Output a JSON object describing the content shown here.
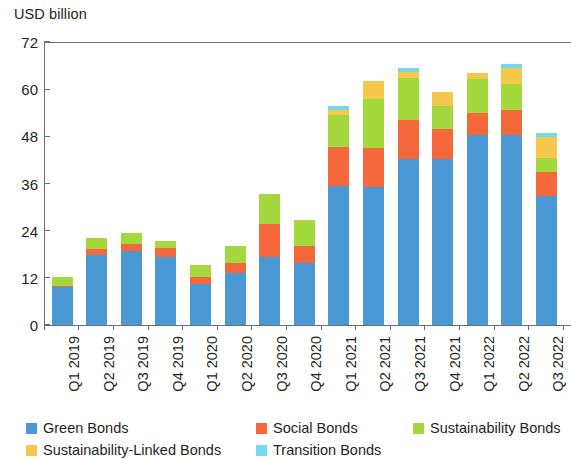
{
  "chart_data": {
    "type": "bar",
    "stacked": true,
    "title": "",
    "subtitle": "",
    "xlabel": "",
    "ylabel": "USD billion",
    "ylim": [
      0,
      72
    ],
    "yticks": [
      0,
      12,
      24,
      36,
      48,
      60,
      72
    ],
    "ytick_labels": [
      "0",
      "12",
      "24",
      "36",
      "48",
      "60",
      "72"
    ],
    "grid": false,
    "legend_position": "bottom",
    "categories": [
      "Q1 2019",
      "Q2 2019",
      "Q3 2019",
      "Q4 2019",
      "Q1 2020",
      "Q2 2020",
      "Q3 2020",
      "Q4 2020",
      "Q1 2021",
      "Q2 2021",
      "Q3 2021",
      "Q4 2021",
      "Q1 2022",
      "Q2 2022",
      "Q3 2022"
    ],
    "series": [
      {
        "name": "Green Bonds",
        "color": "#4a98d4",
        "values": [
          9.7,
          17.8,
          18.8,
          17.3,
          10.4,
          13.3,
          17.3,
          15.7,
          35.4,
          35.2,
          42.3,
          42.3,
          48.4,
          48.4,
          32.8
        ]
      },
      {
        "name": "Social Bonds",
        "color": "#f4683c",
        "values": [
          0.3,
          1.5,
          1.9,
          2.2,
          1.9,
          2.6,
          8.4,
          4.3,
          9.9,
          9.9,
          9.9,
          7.6,
          5.6,
          6.4,
          6.1
        ]
      },
      {
        "name": "Sustainability Bonds",
        "color": "#a3d93c",
        "values": [
          2.2,
          2.8,
          2.8,
          2.0,
          3.1,
          4.3,
          7.6,
          6.6,
          8.1,
          12.5,
          10.7,
          5.9,
          8.6,
          6.4,
          3.6
        ]
      },
      {
        "name": "Sustainability-Linked Bonds",
        "color": "#f5c84d",
        "values": [
          0,
          0,
          0,
          0,
          0,
          0,
          0,
          0,
          1.3,
          4.6,
          1.5,
          3.6,
          1.5,
          4.3,
          5.3
        ]
      },
      {
        "name": "Transition Bonds",
        "color": "#72d9ee",
        "values": [
          0,
          0,
          0,
          0,
          0,
          0,
          0,
          0,
          1.0,
          0,
          1.0,
          0,
          0,
          1.0,
          1.0
        ]
      }
    ],
    "totals": [
      12.2,
      22.1,
      23.5,
      21.5,
      15.4,
      20.2,
      33.3,
      26.6,
      55.7,
      62.2,
      65.4,
      59.4,
      64.1,
      66.5,
      48.8
    ]
  },
  "legend": {
    "items": [
      {
        "label": "Green Bonds",
        "color": "#4a98d4"
      },
      {
        "label": "Social Bonds",
        "color": "#f4683c"
      },
      {
        "label": "Sustainability Bonds",
        "color": "#a3d93c"
      },
      {
        "label": "Sustainability-Linked Bonds",
        "color": "#f5c84d"
      },
      {
        "label": "Transition Bonds",
        "color": "#72d9ee"
      }
    ]
  }
}
